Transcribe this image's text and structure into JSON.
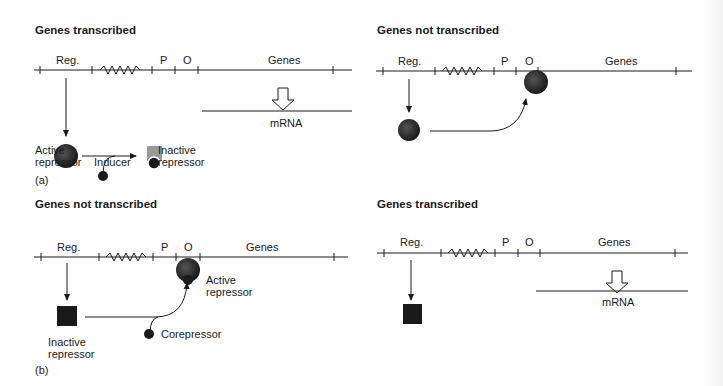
{
  "panels": [
    {
      "title": "Genes transcribed",
      "labels": {
        "reg": "Reg.",
        "p": "P",
        "o": "O",
        "genes": "Genes",
        "mrna": "mRNA",
        "active": "Active repressor",
        "inducer": "Inducer",
        "inactive": "Inactive repressor"
      }
    },
    {
      "title": "Genes not transcribed",
      "labels": {
        "reg": "Reg.",
        "p": "P",
        "o": "O",
        "genes": "Genes"
      }
    },
    {
      "title": "Genes not transcribed",
      "labels": {
        "reg": "Reg.",
        "p": "P",
        "o": "O",
        "genes": "Genes",
        "active": "Active repressor",
        "corepressor": "Corepressor",
        "inactive": "Inactive repressor"
      }
    },
    {
      "title": "Genes transcribed",
      "labels": {
        "reg": "Reg.",
        "p": "P",
        "o": "O",
        "genes": "Genes",
        "mrna": "mRNA"
      }
    }
  ],
  "captions": {
    "a": "(a)",
    "b": "(b)"
  }
}
